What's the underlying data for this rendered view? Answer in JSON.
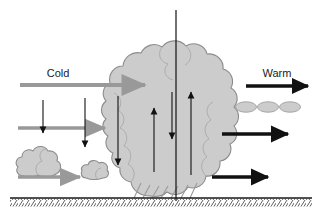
{
  "figure": {
    "name": "squall-line-cross-section",
    "width": 320,
    "height": 218,
    "background_color": "#ffffff"
  },
  "labels": {
    "cold": "Cold",
    "warm": "Warm"
  },
  "colors": {
    "cloud_fill": "#cccccc",
    "cloud_stroke": "#8c8c8c",
    "gray_arrow": "#999999",
    "black_arrow": "#111111",
    "ground_line": "#1a1a1a",
    "hatch_line": "#4d4d4d",
    "precip_streak": "#9a9a9a",
    "text": "#1a1a1a"
  },
  "elements": {
    "cold_inflow_arrow": {
      "name": "cold-inflow-arrow",
      "label": "Cold",
      "color": "#999999",
      "direction": "right",
      "x1": 20,
      "y1": 85,
      "x2": 146,
      "y2": 85
    },
    "gray_arrow_mid": {
      "name": "gray-arrow-mid",
      "color": "#999999",
      "direction": "right",
      "x1": 18,
      "y1": 128,
      "x2": 105,
      "y2": 128
    },
    "gray_arrow_low": {
      "name": "gray-arrow-low",
      "color": "#999999",
      "direction": "right",
      "x1": 18,
      "y1": 177,
      "x2": 80,
      "y2": 177
    },
    "warm_outflow_arrow": {
      "name": "warm-outflow-arrow",
      "label": "Warm",
      "color": "#111111",
      "direction": "right",
      "x1": 246,
      "y1": 86,
      "x2": 312,
      "y2": 86
    },
    "black_arrow_right_mid": {
      "name": "black-arrow-right-mid",
      "color": "#111111",
      "direction": "right",
      "x1": 222,
      "y1": 134,
      "x2": 292,
      "y2": 134
    },
    "black_arrow_right_low": {
      "name": "black-arrow-right-low",
      "color": "#111111",
      "direction": "right",
      "x1": 212,
      "y1": 177,
      "x2": 272,
      "y2": 177
    },
    "downdraft_arrow_1": {
      "name": "downdraft-arrow-left",
      "color": "#111111",
      "direction": "down",
      "x1": 43,
      "y1": 100,
      "x2": 43,
      "y2": 138
    },
    "downdraft_arrow_2": {
      "name": "downdraft-arrow-center",
      "color": "#111111",
      "direction": "down",
      "x1": 85,
      "y1": 98,
      "x2": 85,
      "y2": 152
    },
    "downdraft_arrow_3": {
      "name": "downdraft-arrow-right",
      "color": "#111111",
      "direction": "down",
      "x1": 118,
      "y1": 96,
      "x2": 118,
      "y2": 170
    },
    "updraft_arrow_left": {
      "name": "updraft-arrow-left",
      "color": "#111111",
      "direction": "up",
      "x1": 154,
      "y1": 172,
      "x2": 154,
      "y2": 104
    },
    "mid_downdraft_arrow": {
      "name": "mid-downdraft-arrow",
      "color": "#111111",
      "direction": "down",
      "x1": 175,
      "y1": 92,
      "x2": 175,
      "y2": 143
    },
    "updraft_arrow_right": {
      "name": "updraft-arrow-right",
      "color": "#111111",
      "direction": "up",
      "x1": 191,
      "y1": 175,
      "x2": 191,
      "y2": 88
    },
    "center_axis_line": {
      "name": "center-axis-line",
      "color": "#111111",
      "x": 176,
      "y1": 10,
      "y2": 201
    },
    "cumulonimbus": {
      "name": "cumulonimbus-cloud",
      "fill": "#cccccc",
      "stroke": "#8c8c8c"
    },
    "cumulus_large": {
      "name": "cumulus-cloud-large",
      "fill": "#cccccc",
      "stroke": "#8c8c8c",
      "cx": 41,
      "cy": 163
    },
    "cumulus_small": {
      "name": "cumulus-cloud-small",
      "fill": "#cccccc",
      "stroke": "#8c8c8c",
      "cx": 96,
      "cy": 171
    },
    "lenticular_clouds": {
      "name": "lenticular-cloud-row",
      "fill": "#cccccc",
      "stroke": "#a6a6a6",
      "count": 3,
      "cx": [
        246,
        268,
        290
      ],
      "cy": 107,
      "rx": 10,
      "ry": 5
    },
    "precipitation": {
      "name": "precipitation-streaks",
      "color": "#9a9a9a",
      "count": 7
    },
    "ground": {
      "name": "ground-surface",
      "y": 198,
      "x1": 10,
      "x2": 312,
      "hatch_height": 8
    }
  }
}
